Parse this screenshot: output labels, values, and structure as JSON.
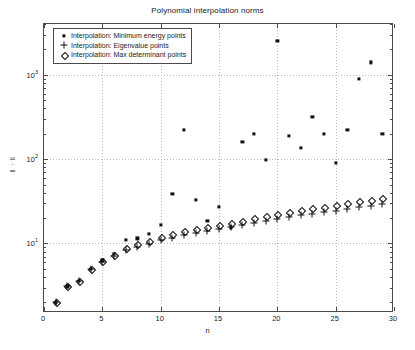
{
  "chart_data": {
    "type": "scatter",
    "title": "Polynomial interpolation norms",
    "xlabel": "n",
    "ylabel": "‖ · ‖",
    "xlim": [
      0,
      30
    ],
    "ylim": [
      1.5,
      4000
    ],
    "yscale": "log",
    "xticks": [
      0,
      5,
      10,
      15,
      20,
      25,
      30
    ],
    "xticklabels": [
      "0",
      "5",
      "10",
      "15",
      "20",
      "25",
      "30"
    ],
    "yticks": [
      10,
      100,
      1000,
      10000
    ],
    "yticklabels": [
      "10¹",
      "10²",
      "10³",
      "10⁴"
    ],
    "ytick_exponents": [
      "1",
      "2",
      "3",
      "4"
    ],
    "grid": true,
    "legend_position": "upper left",
    "series": [
      {
        "name": "Interpolation: Minimum energy points",
        "marker": "square-filled",
        "color": "#111111",
        "x": [
          1,
          2,
          3,
          4,
          5,
          6,
          7,
          8,
          9,
          10,
          11,
          12,
          13,
          14,
          15,
          16,
          17,
          18,
          19,
          20,
          21,
          22,
          23,
          24,
          25,
          26,
          27,
          28,
          29
        ],
        "y": [
          2.0,
          3.1,
          3.6,
          5.0,
          6.3,
          7.6,
          11.0,
          11.5,
          13.0,
          16.5,
          39.0,
          220.0,
          33.0,
          18.5,
          27.0,
          15.5,
          160.0,
          200.0,
          97.0,
          2500.0,
          190.0,
          135.0,
          320.0,
          200.0,
          90.0,
          220.0,
          900.0,
          1400.0,
          200.0
        ]
      },
      {
        "name": "Interpolation: Eigenvalue points",
        "marker": "plus",
        "color": "#111111",
        "x": [
          1,
          2,
          3,
          4,
          5,
          6,
          7,
          8,
          9,
          10,
          11,
          12,
          13,
          14,
          15,
          16,
          17,
          18,
          19,
          20,
          21,
          22,
          23,
          24,
          25,
          26,
          27,
          28,
          29
        ],
        "y": [
          2.0,
          3.1,
          3.6,
          5.0,
          6.0,
          7.1,
          8.4,
          9.2,
          9.9,
          11.0,
          11.6,
          12.6,
          13.4,
          14.0,
          15.0,
          15.8,
          16.6,
          17.6,
          18.6,
          19.5,
          20.6,
          21.6,
          22.6,
          23.6,
          24.6,
          25.6,
          26.8,
          28.0,
          29.5
        ]
      },
      {
        "name": "Interpolation: Max determinant points",
        "marker": "diamond-open",
        "color": "#111111",
        "x": [
          1,
          2,
          3,
          4,
          5,
          6,
          7,
          8,
          9,
          10,
          11,
          12,
          13,
          14,
          15,
          16,
          17,
          18,
          19,
          20,
          21,
          22,
          23,
          24,
          25,
          26,
          27,
          28,
          29
        ],
        "y": [
          2.0,
          3.1,
          3.6,
          5.0,
          6.2,
          7.4,
          8.9,
          9.8,
          10.6,
          11.9,
          12.8,
          13.9,
          14.8,
          15.6,
          16.6,
          17.6,
          18.6,
          19.8,
          21.0,
          22.2,
          23.5,
          24.8,
          26.0,
          27.3,
          28.6,
          30.0,
          31.5,
          33.0,
          35.0
        ]
      }
    ]
  },
  "legend": {
    "items": [
      "Interpolation: Minimum energy points",
      "Interpolation: Eigenvalue points",
      "Interpolation: Max determinant points"
    ]
  }
}
